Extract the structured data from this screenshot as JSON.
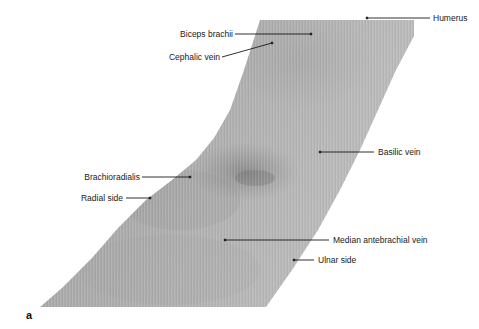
{
  "figure": {
    "panel_letter": "a",
    "colors": {
      "background": "#ffffff",
      "skin_light": "#b9b9b9",
      "skin_mid": "#a8a8a8",
      "skin_dark": "#8e8e8e",
      "leader_line": "#1a1a1a",
      "label_text": "#1a1a1a"
    }
  },
  "labels": [
    {
      "id": "humerus",
      "text": "Humerus",
      "side": "right"
    },
    {
      "id": "biceps-brachii",
      "text": "Biceps brachii",
      "side": "left"
    },
    {
      "id": "cephalic-vein",
      "text": "Cephalic vein",
      "side": "left"
    },
    {
      "id": "basilic-vein",
      "text": "Basilic vein",
      "side": "right"
    },
    {
      "id": "brachioradialis",
      "text": "Brachioradialis",
      "side": "left"
    },
    {
      "id": "radial-side",
      "text": "Radial side",
      "side": "left"
    },
    {
      "id": "median-antebrachial-vein",
      "text": "Median antebrachial vein",
      "side": "right"
    },
    {
      "id": "ulnar-side",
      "text": "Ulnar side",
      "side": "right"
    }
  ]
}
